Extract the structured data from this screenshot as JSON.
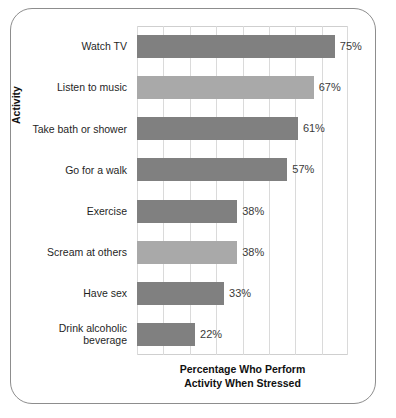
{
  "chart_data": {
    "type": "bar",
    "orientation": "horizontal",
    "title": "",
    "xlabel": "Percentage Who Perform\nActivity When Stressed",
    "ylabel": "Activity",
    "xlim": [
      0,
      80
    ],
    "ylim": null,
    "grid": true,
    "legend": null,
    "gridlines": [
      0,
      10,
      20,
      30,
      40,
      50,
      60,
      70,
      80
    ],
    "categories": [
      "Watch TV",
      "Listen to music",
      "Take bath or shower",
      "Go for a walk",
      "Exercise",
      "Scream at others",
      "Have sex",
      "Drink alcoholic\nbeverage"
    ],
    "values": [
      75,
      67,
      61,
      57,
      38,
      38,
      33,
      22
    ],
    "value_labels": [
      "75%",
      "67%",
      "61%",
      "57%",
      "38%",
      "38%",
      "33%",
      "22%"
    ],
    "bar_colors": [
      "#808080",
      "#a9a9a9",
      "#808080",
      "#808080",
      "#808080",
      "#a9a9a9",
      "#808080",
      "#808080"
    ]
  },
  "figure": {
    "frame_color": "#8d8d8d",
    "grid_color": "#dadada",
    "axis_color": "#cfcfcf",
    "background": "#ffffff"
  }
}
